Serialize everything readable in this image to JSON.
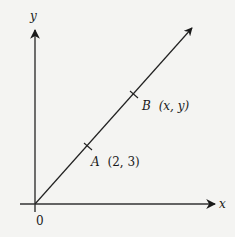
{
  "diagram": {
    "type": "coordinate-plane-line",
    "axes": {
      "x_label": "x",
      "y_label": "y",
      "origin_label": "0"
    },
    "points": [
      {
        "name": "A",
        "coords_text": "(2, 3)"
      },
      {
        "name": "B",
        "coords_text": "(x, y)"
      }
    ],
    "colors": {
      "background": "#f4f4f2",
      "ink": "#1a1a1a"
    }
  }
}
